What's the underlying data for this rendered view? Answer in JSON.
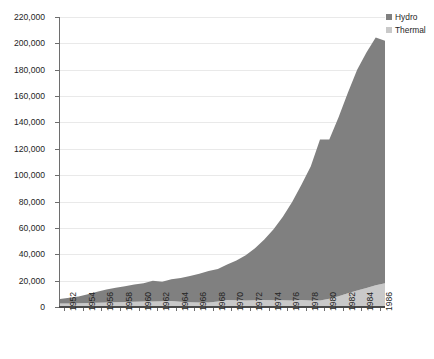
{
  "chart_data": {
    "type": "area",
    "title": "",
    "subtitle": "",
    "xlabel": "",
    "ylabel": "Electric Power in Gigawatt hour (GWh)",
    "ylim": [
      0,
      220000
    ],
    "xlim": [
      1952,
      1987
    ],
    "grid": true,
    "stacked": true,
    "legend_position": "top-right",
    "y_ticks": [
      "0",
      "20,000",
      "40,000",
      "60,000",
      "80,000",
      "100,000",
      "120,000",
      "140,000",
      "160,000",
      "180,000",
      "200,000",
      "220,000"
    ],
    "y_tick_values": [
      0,
      20000,
      40000,
      60000,
      80000,
      100000,
      120000,
      140000,
      160000,
      180000,
      200000,
      220000
    ],
    "x_tick_labels": [
      "1952",
      "1954",
      "1956",
      "1958",
      "1960",
      "1962",
      "1964",
      "1966",
      "1968",
      "1970",
      "1972",
      "1974",
      "1976",
      "1978",
      "1980",
      "1982",
      "1984",
      "1986"
    ],
    "x": [
      1952,
      1953,
      1954,
      1955,
      1956,
      1957,
      1958,
      1959,
      1960,
      1961,
      1962,
      1963,
      1964,
      1965,
      1966,
      1967,
      1968,
      1969,
      1970,
      1971,
      1972,
      1973,
      1974,
      1975,
      1976,
      1977,
      1978,
      1979,
      1980,
      1981,
      1982,
      1983,
      1984,
      1985,
      1986,
      1987
    ],
    "series": [
      {
        "name": "Thermal",
        "color": "#c9c9c9",
        "values": [
          2600,
          2700,
          2900,
          3100,
          3300,
          3500,
          3600,
          3700,
          3900,
          4100,
          4200,
          4300,
          4500,
          3900,
          3600,
          3500,
          3400,
          4200,
          5400,
          5200,
          5000,
          5100,
          5300,
          5200,
          5100,
          5000,
          5400,
          5000,
          4900,
          6200,
          8200,
          10500,
          12500,
          14500,
          16500,
          18000
        ]
      },
      {
        "name": "Hydro",
        "color": "#808080",
        "values": [
          3400,
          4300,
          5100,
          6600,
          8300,
          9700,
          11000,
          12000,
          13200,
          14000,
          15700,
          14900,
          16500,
          18100,
          19900,
          21700,
          23900,
          24600,
          26900,
          30100,
          34200,
          39400,
          45900,
          53800,
          63400,
          74600,
          87300,
          101500,
          122100,
          120800,
          135800,
          152000,
          167500,
          178500,
          188000,
          184000
        ]
      }
    ],
    "totals": [
      6000,
      7000,
      8000,
      9700,
      11600,
      13200,
      14600,
      15700,
      17100,
      18100,
      19900,
      19200,
      21000,
      22000,
      23500,
      25200,
      27300,
      28800,
      32300,
      35300,
      39200,
      44500,
      51200,
      59000,
      68500,
      79600,
      92700,
      106500,
      127000,
      127000,
      144000,
      162500,
      180000,
      193000,
      204500,
      202000
    ]
  },
  "legend": {
    "items": [
      {
        "label": "Hydro",
        "color": "#808080"
      },
      {
        "label": "Thermal",
        "color": "#c9c9c9"
      }
    ]
  },
  "caption": {
    "text": ""
  }
}
